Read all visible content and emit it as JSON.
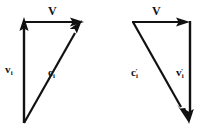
{
  "figure": {
    "name": "velocity-vector-triangles",
    "background_color": "#ffffff",
    "stroke_color": "#111111",
    "panels": [
      {
        "id": "left",
        "name": "before-collision-triangle",
        "labels": {
          "resultant": {
            "base": "V",
            "sub": "",
            "sup": ""
          },
          "vertical": {
            "base": "v",
            "sub": "i",
            "sup": ""
          },
          "diagonal": {
            "base": "c",
            "sub": "i",
            "sup": ""
          }
        }
      },
      {
        "id": "right",
        "name": "after-collision-triangle",
        "labels": {
          "resultant": {
            "base": "V",
            "sub": "",
            "sup": ""
          },
          "vertical": {
            "base": "v",
            "sub": "i",
            "sup": "'"
          },
          "diagonal": {
            "base": "c",
            "sub": "i",
            "sup": "'"
          }
        }
      }
    ],
    "vectors": [
      {
        "panel": "left",
        "name": "vector-v-i",
        "label_id": "label-v-i",
        "x1": 24,
        "y1": 122,
        "x2": 24,
        "y2": 24,
        "arrow_at": "end",
        "direction": "up"
      },
      {
        "panel": "left",
        "name": "vector-V-left",
        "label_id": "label-V-left",
        "x1": 24,
        "y1": 22,
        "x2": 80,
        "y2": 22,
        "arrow_at": "end",
        "direction": "right"
      },
      {
        "panel": "left",
        "name": "vector-c-i",
        "label_id": "label-c-i",
        "x1": 24,
        "y1": 122,
        "x2": 80,
        "y2": 24,
        "arrow_at": "end",
        "direction": "up-right"
      },
      {
        "panel": "right",
        "name": "vector-V-right",
        "label_id": "label-V-right",
        "x1": 133,
        "y1": 22,
        "x2": 190,
        "y2": 22,
        "arrow_at": "end",
        "direction": "right"
      },
      {
        "panel": "right",
        "name": "vector-v-i-prime",
        "label_id": "label-v-i-prime",
        "x1": 190,
        "y1": 23,
        "x2": 190,
        "y2": 120,
        "arrow_at": "end",
        "direction": "down"
      },
      {
        "panel": "right",
        "name": "vector-c-i-prime",
        "label_id": "label-c-i-prime",
        "x1": 133,
        "y1": 23,
        "x2": 188,
        "y2": 120,
        "arrow_at": "end",
        "direction": "down-right"
      }
    ]
  }
}
